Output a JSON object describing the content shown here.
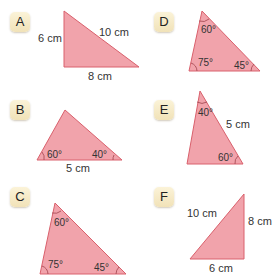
{
  "colors": {
    "triangle_fill": "#f1a3ab",
    "triangle_stroke": "#d9606c",
    "badge_bg": "#f6ebc8"
  },
  "triangles": [
    {
      "id": "A",
      "labels": {
        "left": "6 cm",
        "hyp": "10 cm",
        "bottom": "8 cm"
      }
    },
    {
      "id": "B",
      "labels": {
        "angle_left": "60°",
        "angle_right": "40°",
        "bottom": "5 cm"
      }
    },
    {
      "id": "C",
      "labels": {
        "angle_top": "60°",
        "angle_left": "75°",
        "angle_right": "45°"
      }
    },
    {
      "id": "D",
      "labels": {
        "angle_top": "60°",
        "angle_left": "75°",
        "angle_right": "45°"
      }
    },
    {
      "id": "E",
      "labels": {
        "angle_top": "40°",
        "side_right": "5 cm",
        "angle_bottom": "60°"
      }
    },
    {
      "id": "F",
      "labels": {
        "hyp": "10 cm",
        "right": "8 cm",
        "bottom": "6 cm"
      }
    }
  ]
}
